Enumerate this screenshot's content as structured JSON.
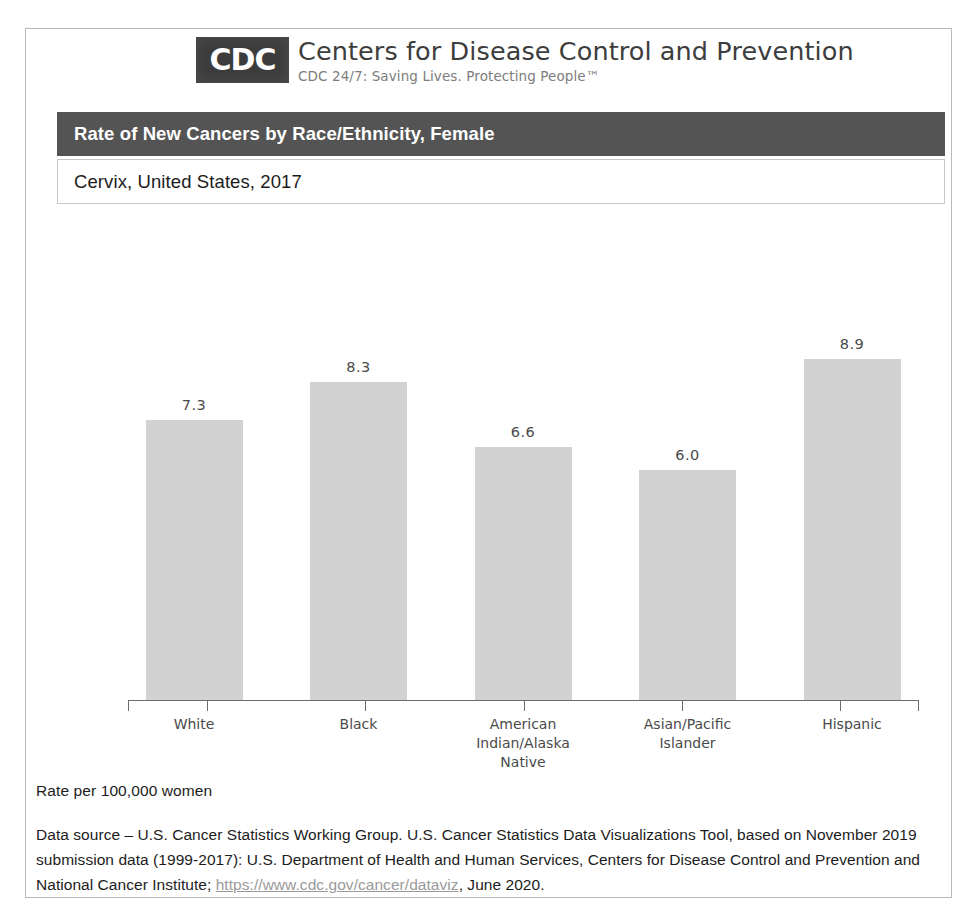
{
  "masthead": {
    "logo_text": "CDC",
    "org_name": "Centers for Disease Control and Prevention",
    "tagline": "CDC 24/7: Saving Lives. Protecting People™"
  },
  "header": {
    "title": "Rate of New Cancers by Race/Ethnicity, Female",
    "subtitle": "Cervix, United States, 2017",
    "title_bar_color": "#545454"
  },
  "footnotes": {
    "rate_note": "Rate per 100,000 women",
    "source_prefix": "Data source – U.S. Cancer Statistics Working Group. U.S. Cancer Statistics Data Visualizations Tool, based on November 2019 submission data (1999-2017): U.S. Department of Health and Human Services, Centers for Disease Control and Prevention and National Cancer Institute; ",
    "source_url": "https://www.cdc.gov/cancer/dataviz",
    "source_suffix": ", June 2020."
  },
  "chart_data": {
    "type": "bar",
    "title": "Rate of New Cancers by Race/Ethnicity, Female",
    "subtitle": "Cervix, United States, 2017",
    "categories": [
      "White",
      "Black",
      "American Indian/Alaska Native",
      "Asian/Pacific Islander",
      "Hispanic"
    ],
    "category_lines": [
      [
        "White"
      ],
      [
        "Black"
      ],
      [
        "American",
        "Indian/Alaska",
        "Native"
      ],
      [
        "Asian/Pacific",
        "Islander"
      ],
      [
        "Hispanic"
      ]
    ],
    "values": [
      7.3,
      8.3,
      6.6,
      6.0,
      8.9
    ],
    "value_labels": [
      "7.3",
      "8.3",
      "6.6",
      "6.0",
      "8.9"
    ],
    "xlabel": "",
    "ylabel": "Rate per 100,000 women",
    "ylim": [
      0,
      13
    ],
    "grid": false,
    "legend": false,
    "bar_color": "#d2d2d2",
    "axis_color": "#6d6d6d"
  }
}
